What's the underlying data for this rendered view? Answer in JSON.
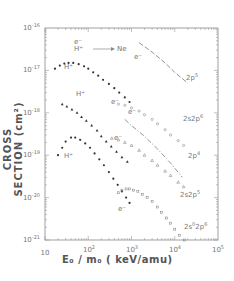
{
  "chart_data": {
    "type": "scatter",
    "title": "",
    "xlabel": "E0 / m0 (keV/amu)",
    "ylabel": "CROSS SECTION (cm²)",
    "xscale": "log",
    "yscale": "log",
    "xlim": [
      10,
      100000
    ],
    "ylim": [
      1e-21,
      1e-16
    ],
    "grid": false,
    "x_ticks": [
      "10",
      "10^2",
      "10^3",
      "10^4",
      "10^5"
    ],
    "y_ticks": [
      "10^-16",
      "10^-17",
      "10^-18",
      "10^-19",
      "10^-20",
      "10^-21"
    ],
    "legend_annotation": "e⁻ / H⁺ → Ne",
    "series": [
      {
        "name": "H+ 2p5",
        "projectile": "H+",
        "shell": "2p5",
        "marker": "filled-circle",
        "x": [
          17,
          22,
          28,
          35,
          45,
          60,
          80,
          100,
          130,
          170,
          220,
          300,
          400,
          520,
          700,
          900
        ],
        "y": [
          1.1e-17,
          1.3e-17,
          1.45e-17,
          1.5e-17,
          1.5e-17,
          1.4e-17,
          1.25e-17,
          1.1e-17,
          9e-18,
          7.5e-18,
          6e-18,
          4.8e-18,
          3.8e-18,
          3e-18,
          2.3e-18,
          1.8e-18
        ]
      },
      {
        "name": "e- 2p5",
        "projectile": "e-",
        "shell": "2p5",
        "marker": "dashed-line",
        "x": [
          1500,
          3000,
          6000,
          10000,
          20000
        ],
        "y": [
          4.5e-17,
          2.7e-17,
          1.5e-17,
          9e-18,
          5e-18
        ]
      },
      {
        "name": "H+ 2s2p6",
        "projectile": "H+",
        "shell": "2s2p6",
        "marker": "filled-triangle",
        "x": [
          25,
          32,
          42,
          55,
          70,
          90,
          120,
          160,
          200,
          260,
          340,
          450,
          600,
          800
        ],
        "y": [
          1.6e-18,
          1.4e-18,
          1.2e-18,
          1e-18,
          8e-19,
          6.5e-19,
          5e-19,
          3.8e-19,
          2.8e-19,
          2.1e-19,
          1.6e-19,
          1.2e-19,
          9e-20,
          7e-20
        ]
      },
      {
        "name": "e- 2s2p6",
        "projectile": "e-",
        "shell": "2s2p6",
        "marker": "open-circle",
        "x": [
          500,
          700,
          1000,
          1500,
          2000,
          3000,
          4000,
          6000,
          8000,
          12000,
          16000
        ],
        "y": [
          1.6e-18,
          1.5e-18,
          1.3e-18,
          1.1e-18,
          9e-19,
          7e-19,
          5.5e-19,
          4e-19,
          3e-19,
          2.2e-19,
          1.7e-19
        ]
      },
      {
        "name": "e- 2p4",
        "projectile": "e-",
        "shell": "2p4",
        "marker": "dash-dot-line",
        "x": [
          700,
          1000,
          2000,
          4000,
          8000,
          15000
        ],
        "y": [
          7e-19,
          5e-19,
          2.8e-19,
          1.4e-19,
          6.5e-20,
          3e-20
        ]
      },
      {
        "name": "H+ 2s2p5",
        "projectile": "H+",
        "shell": "2s2p5",
        "marker": "filled-circle",
        "x": [
          20,
          25,
          30,
          40,
          50,
          65,
          85,
          110,
          140,
          180,
          230,
          300,
          380,
          480,
          600,
          750,
          900
        ],
        "y": [
          1e-19,
          1.5e-19,
          2.1e-19,
          2.6e-19,
          2.6e-19,
          2.3e-19,
          1.9e-19,
          1.5e-19,
          1.1e-19,
          8e-20,
          5.8e-20,
          4e-20,
          2.8e-20,
          2e-20,
          1.4e-20,
          1e-20,
          7.5e-21
        ]
      },
      {
        "name": "e- 2s2p5",
        "projectile": "e-",
        "shell": "2s2p5",
        "marker": "open-triangle",
        "x": [
          350,
          500,
          700,
          1000,
          1500,
          2000,
          3000,
          4000,
          6000,
          8000,
          12000,
          16000
        ],
        "y": [
          2.5e-19,
          2.3e-19,
          2e-19,
          1.7e-19,
          1.3e-19,
          1e-19,
          7.5e-20,
          5.8e-20,
          4.2e-20,
          3.3e-20,
          2.3e-20,
          1.8e-20
        ]
      },
      {
        "name": "e- 2s0 2p6",
        "projectile": "e-",
        "shell": "2s0 2p6",
        "marker": "open-square",
        "x": [
          500,
          600,
          750,
          900,
          1100,
          1400,
          1800,
          2300,
          3000,
          4000,
          5000,
          6500,
          8000,
          10000,
          13000,
          17000
        ],
        "y": [
          1.3e-20,
          1.5e-20,
          1.6e-20,
          1.6e-20,
          1.5e-20,
          1.4e-20,
          1.2e-20,
          1e-20,
          8e-21,
          6e-21,
          4.5e-21,
          3.3e-21,
          2.5e-21,
          1.8e-21,
          1.3e-21,
          1e-21
        ]
      }
    ],
    "annotations": [
      {
        "text": "H⁺",
        "near": "H+ 2p5"
      },
      {
        "text": "H⁺",
        "near": "H+ 2s2p6"
      },
      {
        "text": "H⁺",
        "near": "H+ 2s2p5"
      },
      {
        "text": "e⁻",
        "near": "e- 2p5"
      },
      {
        "text": "e⁻",
        "near": "e- 2s2p6"
      },
      {
        "text": "e⁻",
        "near": "e- 2p4"
      },
      {
        "text": "e⁻",
        "near": "e- 2s2p5"
      },
      {
        "text": "e⁻",
        "near": "e- 2s0 2p6"
      },
      {
        "text": "2p5"
      },
      {
        "text": "2s2p6"
      },
      {
        "text": "2p4"
      },
      {
        "text": "2s2p5"
      },
      {
        "text": "2s0 2p6"
      }
    ]
  },
  "labels": {
    "y_title": "CROSS SECTION (cm²)",
    "x_title": "E₀ / m₀ ( keV/amu)",
    "legend_e": "e⁻",
    "legend_h": "H⁺",
    "legend_target": "Ne",
    "yt": [
      "10",
      "10",
      "10",
      "10",
      "10",
      "10"
    ],
    "yt_exp": [
      "-16",
      "-17",
      "-18",
      "-19",
      "-20",
      "-21"
    ],
    "xt": [
      "10",
      "10",
      "10",
      "10",
      "10"
    ],
    "xt_exp": [
      "",
      "2",
      "3",
      "4",
      "5"
    ],
    "curve_2p5": "2p",
    "curve_2p5_sup": "5",
    "curve_2s2p6": "2s2p",
    "curve_2s2p6_sup": "6",
    "curve_2p4": "2p",
    "curve_2p4_sup": "4",
    "curve_2s2p5": "2s2p",
    "curve_2s2p5_sup": "5",
    "curve_2s02p6_a": "2s",
    "curve_2s02p6_a_sup": "0",
    "curve_2s02p6_b": "2p",
    "curve_2s02p6_b_sup": "6",
    "h_plus": "H⁺",
    "e_minus": "e⁻"
  }
}
